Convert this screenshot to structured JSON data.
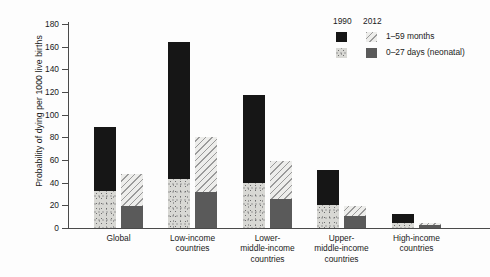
{
  "chart_data": {
    "type": "bar",
    "subtype": "grouped-stacked",
    "title": "",
    "xlabel": "",
    "ylabel": "Probability of dying per 1000 live births",
    "ylim": [
      0,
      180
    ],
    "yticks": [
      0,
      20,
      40,
      60,
      80,
      100,
      120,
      140,
      160,
      180
    ],
    "grid": false,
    "legend_position": "top-right",
    "categories": [
      "Global",
      "Low-income countries",
      "Lower-middle-income countries",
      "Upper-middle-income countries",
      "High-income countries"
    ],
    "groups": [
      "1990",
      "2012"
    ],
    "stack_segments": [
      "0–27 days (neonatal)",
      "1–59 months"
    ],
    "series": [
      {
        "name": "1990 — 0–27 days (neonatal)",
        "year": "1990",
        "segment": "0–27 days (neonatal)",
        "values": [
          33,
          43,
          40,
          20,
          4
        ]
      },
      {
        "name": "1990 — 1–59 months",
        "year": "1990",
        "segment": "1–59 months",
        "values": [
          56,
          121,
          77,
          31,
          8
        ]
      },
      {
        "name": "2012 — 0–27 days (neonatal)",
        "year": "2012",
        "segment": "0–27 days (neonatal)",
        "values": [
          19,
          32,
          26,
          11,
          3
        ]
      },
      {
        "name": "2012 — 1–59 months",
        "year": "2012",
        "segment": "1–59 months",
        "values": [
          29,
          48,
          33,
          8,
          1
        ]
      }
    ],
    "totals": {
      "1990": [
        89,
        164,
        117,
        51,
        12
      ],
      "2012": [
        48,
        80,
        59,
        19,
        4
      ]
    }
  },
  "axis": {
    "y_title": "Probability of dying per 1000 live births",
    "y_tick_labels": [
      "180",
      "160",
      "140",
      "120",
      "100",
      "80",
      "60",
      "40",
      "20",
      "0"
    ]
  },
  "categories": [
    {
      "id": "global",
      "label": "Global"
    },
    {
      "id": "low-income",
      "label": "Low-income\ncountries"
    },
    {
      "id": "lower-middle-income",
      "label": "Lower-\nmiddle-income\ncountries"
    },
    {
      "id": "upper-middle-income",
      "label": "Upper-\nmiddle-income\ncountries"
    },
    {
      "id": "high-income",
      "label": "High-income\ncountries"
    }
  ],
  "legend": {
    "year_1990": "1990",
    "year_2012": "2012",
    "rows": [
      {
        "id": "age-1-59-months",
        "label": "1–59 months"
      },
      {
        "id": "age-0-27-days",
        "label": "0–27 days (neonatal)"
      }
    ]
  },
  "colors": {
    "black_1990_upper": "#161616",
    "stipple_1990_lower": "#d8d8d4",
    "hatch_2012_upper": "#9a9a9a",
    "gray_2012_lower": "#5a5a5a",
    "axis": "#4a4a4a",
    "text": "#1a1a1a"
  }
}
